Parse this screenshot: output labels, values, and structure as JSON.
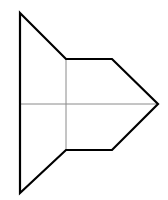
{
  "diagram": {
    "background": "#ffffff",
    "stroke_color": "#000000",
    "guide_color": "#8a8a8a",
    "outline_points": "20,13 66,59 112,59 158,104 112,150 66,150 20,193",
    "guides": {
      "horizontal": {
        "x1": 20,
        "y1": 104,
        "x2": 158,
        "y2": 104
      },
      "vertical": {
        "x1": 66,
        "y1": 59,
        "x2": 66,
        "y2": 150
      }
    }
  }
}
